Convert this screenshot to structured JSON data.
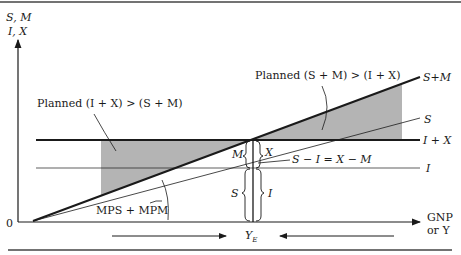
{
  "diagram": {
    "axes": {
      "y_label_line1": "S, M",
      "y_label_line2": "I, X",
      "x_label_line1": "GNP",
      "x_label_line2": "or Y",
      "origin": "0"
    },
    "curves": {
      "s_plus_m": "S+M",
      "s": "S",
      "i_plus_x": "I + X",
      "i": "I"
    },
    "annotations": {
      "left_region": "Planned (I + X) > (S + M)",
      "right_region": "Planned (S + M) > (I + X)",
      "slope": "MPS + MPM",
      "identity": "S − I = X − M",
      "brace_m": "M",
      "brace_x": "X",
      "brace_s": "S",
      "brace_i": "I",
      "equilibrium": "Y",
      "equilibrium_sub": "E"
    },
    "colors": {
      "line": "#1a1a1a",
      "shade": "#b4b4b4"
    }
  }
}
